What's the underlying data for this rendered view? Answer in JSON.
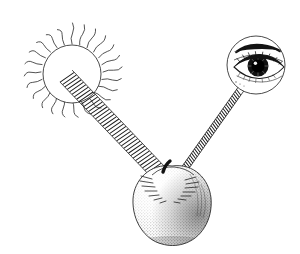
{
  "illustration": {
    "title": "Light Path From Sun To Apple To Eye",
    "style": "pen-and-ink stipple engraving",
    "background_color": "#ffffff",
    "ink_color": "#1a1a1a",
    "canvas": {
      "width": 300,
      "height": 254
    },
    "caption": "",
    "labels": []
  },
  "sun": {
    "name": "Sun",
    "center_x": 72,
    "center_y": 74,
    "disk_radius": 29,
    "ray_count": 24,
    "ray_inner_radius": 30,
    "ray_outer_radius": 57,
    "ray_style": "wavy",
    "outline_color": "#2b2b2b",
    "fill_color": "#ffffff"
  },
  "apple": {
    "name": "Apple",
    "center_x": 172,
    "center_y": 203,
    "width": 80,
    "height": 84,
    "stem_present": true,
    "stem_color": "#111111",
    "shading": "stippled, darker on lower right",
    "highlight_side": "left",
    "outline_color": "#2b2b2b"
  },
  "eye": {
    "name": "Eye",
    "center_x": 256,
    "center_y": 65,
    "circle_radius": 29,
    "pupil_radius": 7,
    "iris_radius": 11,
    "eyebrow_present": true,
    "lashes_present": true,
    "pupil_color": "#000000",
    "outline_color": "#2b2b2b"
  },
  "beams": [
    {
      "id": "sun-to-apple",
      "label": "Incident light",
      "from": "sun",
      "to": "apple",
      "x1": 66,
      "y1": 76,
      "x2": 164,
      "y2": 178,
      "band_width": 17,
      "style": "hatched band",
      "direction": "sun to apple"
    },
    {
      "id": "apple-to-eye",
      "label": "Reflected light",
      "from": "apple",
      "to": "eye",
      "x1": 178,
      "y1": 178,
      "x2": 241,
      "y2": 89,
      "band_width": 7,
      "style": "zigzag sawtooth line",
      "direction": "apple to eye"
    }
  ]
}
